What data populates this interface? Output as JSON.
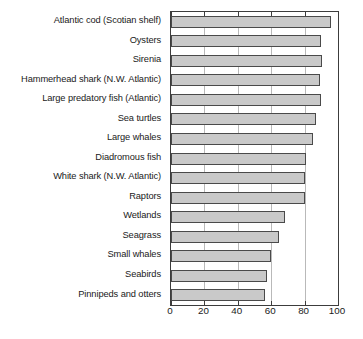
{
  "chart_data": {
    "type": "bar",
    "orientation": "horizontal",
    "title": "",
    "subtitle": "",
    "xlabel": "",
    "ylabel": "",
    "xlim": [
      0,
      100
    ],
    "ylim": null,
    "grid": true,
    "grid_axis": "x",
    "legend": false,
    "legend_position": "none",
    "bar_color": "#c9c9c9",
    "bar_border_color": "#4a4a4a",
    "axis_color": "#3c3c3c",
    "gridline_color": "#b9b9b9",
    "background": "#ffffff",
    "xticks": [
      0,
      20,
      40,
      60,
      80,
      100
    ],
    "xtick_labels": [
      "0",
      "20",
      "40",
      "60",
      "80",
      "100"
    ],
    "categories": [
      "Atlantic cod (Scotian shelf)",
      "Oysters",
      "Sirenia",
      "Hammerhead shark (N.W. Atlantic)",
      "Large predatory fish (Atlantic)",
      "Sea turtles",
      "Large whales",
      "Diadromous fish",
      "White shark (N.W. Atlantic)",
      "Raptors",
      "Wetlands",
      "Seagrass",
      "Small whales",
      "Seabirds",
      "Pinnipeds and otters"
    ],
    "values": [
      96,
      90,
      90.5,
      89,
      90,
      87,
      85,
      81,
      80,
      80,
      68.5,
      64.5,
      60,
      57.5,
      56.5
    ],
    "series": [
      {
        "name": "Percent decline",
        "values": [
          96,
          90,
          90.5,
          89,
          90,
          87,
          85,
          81,
          80,
          80,
          68.5,
          64.5,
          60,
          57.5,
          56.5
        ]
      }
    ]
  }
}
